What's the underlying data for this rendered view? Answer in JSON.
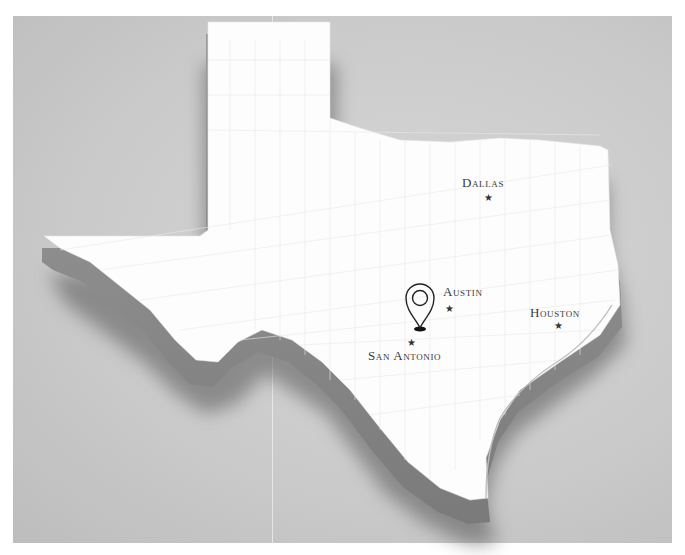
{
  "map": {
    "title": "Texas",
    "background_color": "#c9c9c9",
    "land_color": "#ffffff",
    "extrusion_color": "#8f8f8f",
    "label_color": "#3a3a3a",
    "marker_icon": "star-icon",
    "pin_icon": "location-pin-icon",
    "cities": [
      {
        "name": "Dallas",
        "label": "Dallas",
        "label_x": 449,
        "label_y": 176,
        "star_x": 472,
        "star_y": 193
      },
      {
        "name": "Austin",
        "label": "Austin",
        "label_x": 442,
        "label_y": 285,
        "star_x": 445,
        "star_y": 304
      },
      {
        "name": "Houston",
        "label": "Houston",
        "label_x": 529,
        "label_y": 306,
        "star_x": 555,
        "star_y": 323
      },
      {
        "name": "San Antonio",
        "label": "San Antonio",
        "label_x": 368,
        "label_y": 349,
        "star_x": 409,
        "star_y": 340
      }
    ],
    "pin": {
      "x": 420,
      "y": 303,
      "near": "San Antonio"
    }
  }
}
